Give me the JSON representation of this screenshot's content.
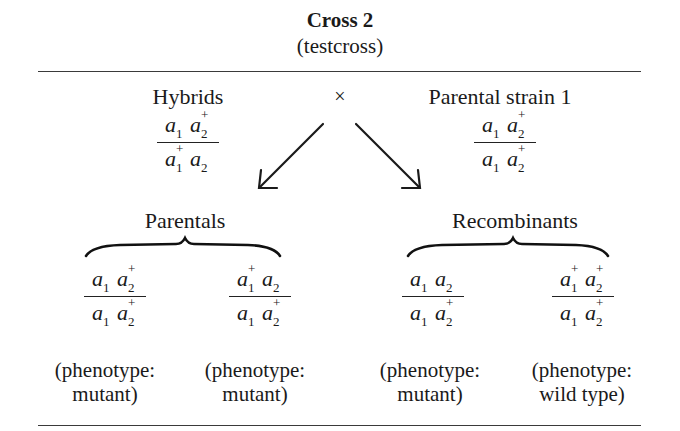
{
  "header": {
    "title": "Cross 2",
    "subtitle": "(testcross)"
  },
  "cross": {
    "left_parent": {
      "label": "Hybrids",
      "genotype": {
        "top": [
          {
            "base": "a",
            "sub": "1",
            "sup": ""
          },
          {
            "base": "a",
            "sub": "2",
            "sup": "+"
          }
        ],
        "bottom": [
          {
            "base": "a",
            "sub": "1",
            "sup": "+"
          },
          {
            "base": "a",
            "sub": "2",
            "sup": ""
          }
        ]
      }
    },
    "operator": "×",
    "right_parent": {
      "label": "Parental strain 1",
      "genotype": {
        "top": [
          {
            "base": "a",
            "sub": "1",
            "sup": ""
          },
          {
            "base": "a",
            "sub": "2",
            "sup": "+"
          }
        ],
        "bottom": [
          {
            "base": "a",
            "sub": "1",
            "sup": ""
          },
          {
            "base": "a",
            "sub": "2",
            "sup": "+"
          }
        ]
      }
    }
  },
  "groups": [
    {
      "label": "Parentals",
      "progeny": [
        {
          "top": [
            {
              "base": "a",
              "sub": "1",
              "sup": ""
            },
            {
              "base": "a",
              "sub": "2",
              "sup": "+"
            }
          ],
          "bottom": [
            {
              "base": "a",
              "sub": "1",
              "sup": ""
            },
            {
              "base": "a",
              "sub": "2",
              "sup": "+"
            }
          ],
          "phenotype_line1": "(phenotype:",
          "phenotype_line2": "mutant)"
        },
        {
          "top": [
            {
              "base": "a",
              "sub": "1",
              "sup": "+"
            },
            {
              "base": "a",
              "sub": "2",
              "sup": ""
            }
          ],
          "bottom": [
            {
              "base": "a",
              "sub": "1",
              "sup": ""
            },
            {
              "base": "a",
              "sub": "2",
              "sup": "+"
            }
          ],
          "phenotype_line1": "(phenotype:",
          "phenotype_line2": "mutant)"
        }
      ]
    },
    {
      "label": "Recombinants",
      "progeny": [
        {
          "top": [
            {
              "base": "a",
              "sub": "1",
              "sup": ""
            },
            {
              "base": "a",
              "sub": "2",
              "sup": ""
            }
          ],
          "bottom": [
            {
              "base": "a",
              "sub": "1",
              "sup": ""
            },
            {
              "base": "a",
              "sub": "2",
              "sup": "+"
            }
          ],
          "phenotype_line1": "(phenotype:",
          "phenotype_line2": "mutant)"
        },
        {
          "top": [
            {
              "base": "a",
              "sub": "1",
              "sup": "+"
            },
            {
              "base": "a",
              "sub": "2",
              "sup": "+"
            }
          ],
          "bottom": [
            {
              "base": "a",
              "sub": "1",
              "sup": ""
            },
            {
              "base": "a",
              "sub": "2",
              "sup": "+"
            }
          ],
          "phenotype_line1": "(phenotype:",
          "phenotype_line2": "wild type)"
        }
      ]
    }
  ]
}
